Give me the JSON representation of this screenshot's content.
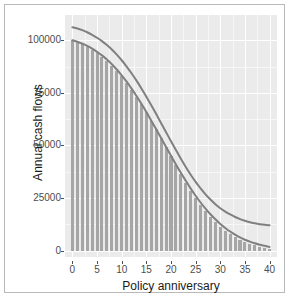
{
  "chart_data": {
    "type": "bar",
    "title": "",
    "subtitle": "",
    "xlabel": "Policy anniversary",
    "ylabel": "Annual cash flows",
    "xlim": [
      -1.5,
      41.5
    ],
    "ylim": [
      -3000,
      112000
    ],
    "grid": true,
    "legend": null,
    "legend_position": "none",
    "xticks": [
      0,
      5,
      10,
      15,
      20,
      25,
      30,
      35,
      40
    ],
    "xtick_labels": [
      "0",
      "5",
      "10",
      "15",
      "20",
      "25",
      "30",
      "35",
      "40"
    ],
    "yticks": [
      0,
      25000,
      50000,
      75000,
      100000
    ],
    "ytick_labels": [
      "0",
      "25000",
      "50000",
      "75000",
      "100000"
    ],
    "x": [
      0,
      1,
      2,
      3,
      4,
      5,
      6,
      7,
      8,
      9,
      10,
      11,
      12,
      13,
      14,
      15,
      16,
      17,
      18,
      19,
      20,
      21,
      22,
      23,
      24,
      25,
      26,
      27,
      28,
      29,
      30,
      31,
      32,
      33,
      34,
      35,
      36,
      37,
      38,
      39,
      40
    ],
    "bar_series": {
      "name": "Annual cash flows",
      "color": "#a6a6a6",
      "values": [
        100000,
        99200,
        98200,
        97000,
        95600,
        94000,
        92200,
        90200,
        88000,
        85500,
        82800,
        79800,
        76600,
        73200,
        69600,
        65800,
        61800,
        57700,
        53500,
        49200,
        44900,
        40600,
        36400,
        32400,
        28600,
        25000,
        21700,
        18700,
        16000,
        13600,
        11400,
        9500,
        7800,
        6400,
        5100,
        4100,
        3200,
        2500,
        1900,
        1400,
        1000
      ]
    },
    "series": [
      {
        "name": "upper-curve",
        "color": "#808080",
        "values": [
          106200,
          105600,
          104800,
          103800,
          102600,
          101200,
          99600,
          97700,
          95600,
          93200,
          90500,
          87500,
          84300,
          80800,
          77100,
          73200,
          69100,
          64900,
          60600,
          56300,
          52000,
          47800,
          43700,
          39800,
          36100,
          32700,
          29600,
          26800,
          24300,
          22100,
          20200,
          18600,
          17200,
          16000,
          15000,
          14200,
          13500,
          13000,
          12600,
          12300,
          12100
        ]
      },
      {
        "name": "lower-curve",
        "color": "#808080",
        "values": [
          100000,
          99300,
          98400,
          97300,
          96000,
          94500,
          92800,
          90800,
          88600,
          86100,
          83300,
          80300,
          77000,
          73500,
          69800,
          65900,
          61800,
          57700,
          53500,
          49300,
          45100,
          41000,
          37000,
          33200,
          29500,
          26100,
          22900,
          20000,
          17300,
          14900,
          12700,
          10800,
          9100,
          7600,
          6300,
          5200,
          4300,
          3500,
          2800,
          2300,
          1800
        ]
      }
    ],
    "panel_background": "#ebebeb",
    "grid_color": "#ffffff",
    "axis_text_color": "#4d4d4d",
    "axis_title_color": "#1a1a1a",
    "curve_color": "#808080",
    "bar_color": "#a6a6a6",
    "frame_color": "#b9b9b9"
  }
}
